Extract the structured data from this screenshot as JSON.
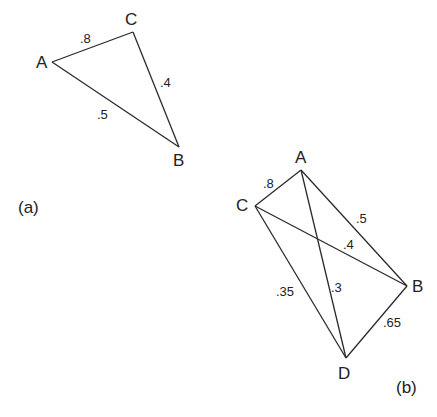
{
  "diagrams": [
    {
      "id": "a",
      "caption": "(a)",
      "caption_pos": [
        18,
        213
      ],
      "vertices": [
        {
          "name": "A",
          "x": 52,
          "y": 62,
          "label_x": 36,
          "label_y": 68
        },
        {
          "name": "C",
          "x": 133,
          "y": 32,
          "label_x": 125,
          "label_y": 25
        },
        {
          "name": "B",
          "x": 179,
          "y": 147,
          "label_x": 173,
          "label_y": 166
        }
      ],
      "edges": [
        {
          "from": "A",
          "to": "C",
          "weight": ".8",
          "label_x": 80,
          "label_y": 43
        },
        {
          "from": "C",
          "to": "B",
          "weight": ".4",
          "label_x": 160,
          "label_y": 87
        },
        {
          "from": "A",
          "to": "B",
          "weight": ".5",
          "label_x": 97,
          "label_y": 119
        }
      ]
    },
    {
      "id": "b",
      "caption": "(b)",
      "caption_pos": [
        396,
        393
      ],
      "vertices": [
        {
          "name": "A",
          "x": 301,
          "y": 170,
          "label_x": 295,
          "label_y": 163
        },
        {
          "name": "C",
          "x": 255,
          "y": 206,
          "label_x": 236,
          "label_y": 211
        },
        {
          "name": "B",
          "x": 407,
          "y": 286,
          "label_x": 412,
          "label_y": 292
        },
        {
          "name": "D",
          "x": 346,
          "y": 358,
          "label_x": 338,
          "label_y": 379
        }
      ],
      "edges": [
        {
          "from": "C",
          "to": "A",
          "weight": ".8",
          "label_x": 263,
          "label_y": 188
        },
        {
          "from": "A",
          "to": "B",
          "weight": ".5",
          "label_x": 356,
          "label_y": 223
        },
        {
          "from": "C",
          "to": "B",
          "weight": ".4",
          "label_x": 343,
          "label_y": 249
        },
        {
          "from": "C",
          "to": "D",
          "weight": ".35",
          "label_x": 276,
          "label_y": 296
        },
        {
          "from": "A",
          "to": "D",
          "weight": ".3",
          "label_x": 331,
          "label_y": 292
        },
        {
          "from": "B",
          "to": "D",
          "weight": ".65",
          "label_x": 383,
          "label_y": 327
        }
      ]
    }
  ]
}
